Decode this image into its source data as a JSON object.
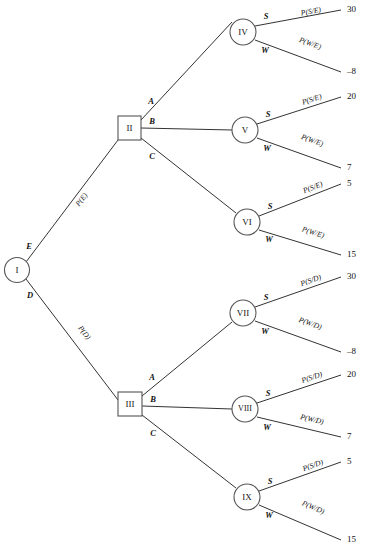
{
  "diagram": {
    "type": "decision-tree",
    "title": "",
    "root": {
      "id": "I",
      "shape": "circle",
      "label": "I",
      "cx": 17,
      "cy": 270,
      "r": 12.5
    },
    "decision_nodes": [
      {
        "id": "II",
        "shape": "square",
        "label": "II",
        "x": 118,
        "y": 116,
        "w": 23,
        "h": 24
      },
      {
        "id": "III",
        "shape": "square",
        "label": "III",
        "x": 118,
        "y": 392,
        "w": 24,
        "h": 24
      }
    ],
    "chance_nodes": [
      {
        "id": "IV",
        "shape": "circle",
        "label": "IV",
        "cx": 243,
        "cy": 32,
        "r": 13
      },
      {
        "id": "V",
        "shape": "circle",
        "label": "V",
        "cx": 245,
        "cy": 130,
        "r": 13
      },
      {
        "id": "VI",
        "shape": "circle",
        "label": "VI",
        "cx": 247,
        "cy": 222,
        "r": 13
      },
      {
        "id": "VII",
        "shape": "circle",
        "label": "VII",
        "cx": 243,
        "cy": 313,
        "r": 13
      },
      {
        "id": "VIII",
        "shape": "circle",
        "label": "VIII",
        "cx": 245,
        "cy": 409,
        "r": 13
      },
      {
        "id": "IX",
        "shape": "circle",
        "label": "IX",
        "cx": 247,
        "cy": 497,
        "r": 13
      }
    ],
    "root_branches": [
      {
        "letter": "E",
        "prob": "P(E)",
        "from": "I",
        "to": "II"
      },
      {
        "letter": "D",
        "prob": "P(D)",
        "from": "I",
        "to": "III"
      }
    ],
    "decision_branches": [
      {
        "parent": "II",
        "letter": "A",
        "to": "IV"
      },
      {
        "parent": "II",
        "letter": "B",
        "to": "V"
      },
      {
        "parent": "II",
        "letter": "C",
        "to": "VI"
      },
      {
        "parent": "III",
        "letter": "A",
        "to": "VII"
      },
      {
        "parent": "III",
        "letter": "B",
        "to": "VIII"
      },
      {
        "parent": "III",
        "letter": "C",
        "to": "IX"
      }
    ],
    "outcomes": [
      {
        "node": "IV",
        "branch": "S",
        "prob": "P(S/E)",
        "payoff": "30"
      },
      {
        "node": "IV",
        "branch": "W",
        "prob": "P(W/E)",
        "payoff": "–8"
      },
      {
        "node": "V",
        "branch": "S",
        "prob": "P(S/E)",
        "payoff": "20"
      },
      {
        "node": "V",
        "branch": "W",
        "prob": "P(W/E)",
        "payoff": "7"
      },
      {
        "node": "VI",
        "branch": "S",
        "prob": "P(S/E)",
        "payoff": "5"
      },
      {
        "node": "VI",
        "branch": "W",
        "prob": "P(W/E)",
        "payoff": "15"
      },
      {
        "node": "VII",
        "branch": "S",
        "prob": "P(S/D)",
        "payoff": "30"
      },
      {
        "node": "VII",
        "branch": "W",
        "prob": "P(W/D)",
        "payoff": "–8"
      },
      {
        "node": "VIII",
        "branch": "S",
        "prob": "P(S/D)",
        "payoff": "20"
      },
      {
        "node": "VIII",
        "branch": "W",
        "prob": "P(W/D)",
        "payoff": "7"
      },
      {
        "node": "IX",
        "branch": "S",
        "prob": "P(S/D)",
        "payoff": "5"
      },
      {
        "node": "IX",
        "branch": "W",
        "prob": "P(W/D)",
        "payoff": "15"
      }
    ],
    "colors": {
      "line": "#333333",
      "node_stroke": "#555555",
      "node_fill": "#ffffff",
      "text": "#111111",
      "background": "#ffffff"
    }
  }
}
